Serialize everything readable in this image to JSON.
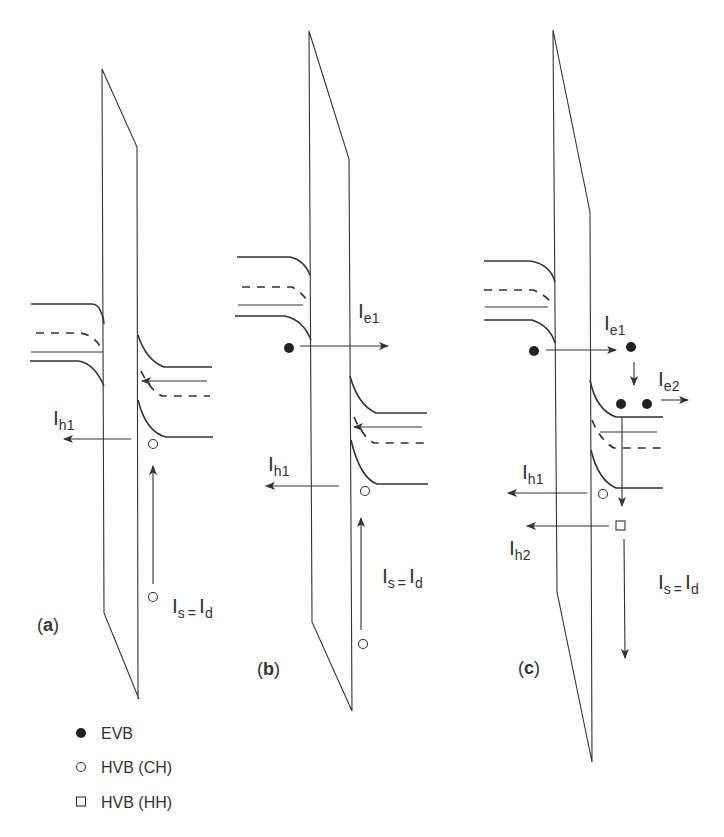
{
  "figure": {
    "panels": [
      {
        "id": "a",
        "label_open": "(",
        "label_letter": "a",
        "label_close": ")",
        "currents": {
          "ih1": {
            "main": "I",
            "sub": "h1"
          },
          "is": {
            "main": "I",
            "sub": "s"
          },
          "eq": "=",
          "id": {
            "main": "I",
            "sub": "d"
          }
        }
      },
      {
        "id": "b",
        "label_open": "(",
        "label_letter": "b",
        "label_close": ")",
        "currents": {
          "ie1": {
            "main": "I",
            "sub": "e1"
          },
          "ih1": {
            "main": "I",
            "sub": "h1"
          },
          "is": {
            "main": "I",
            "sub": "s"
          },
          "eq": "=",
          "id": {
            "main": "I",
            "sub": "d"
          }
        }
      },
      {
        "id": "c",
        "label_open": "(",
        "label_letter": "c",
        "label_close": ")",
        "currents": {
          "ie1": {
            "main": "I",
            "sub": "e1"
          },
          "ie2": {
            "main": "I",
            "sub": "e2"
          },
          "ih1": {
            "main": "I",
            "sub": "h1"
          },
          "ih2": {
            "main": "I",
            "sub": "h2"
          },
          "is": {
            "main": "I",
            "sub": "s"
          },
          "eq": "=",
          "id": {
            "main": "I",
            "sub": "d"
          }
        }
      }
    ],
    "legend": [
      {
        "symbol": "filled-circle",
        "label": "EVB"
      },
      {
        "symbol": "open-circle",
        "label": "HVB (CH)"
      },
      {
        "symbol": "open-square",
        "label": "HVB (HH)"
      }
    ],
    "colors": {
      "line": "#333333",
      "background": "#ffffff"
    }
  }
}
